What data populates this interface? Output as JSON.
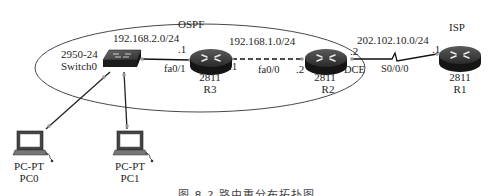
{
  "diagram": {
    "area_label": "OSPF",
    "isp_label": "ISP",
    "networks": [
      {
        "id": "lan",
        "label": "192.168.2.0/24"
      },
      {
        "id": "r3-r2",
        "label": "192.168.1.0/24"
      },
      {
        "id": "r2-r1",
        "label": "202.102.10.0/24"
      }
    ],
    "devices": {
      "switch0": {
        "model": "2950-24",
        "name": "Switch0"
      },
      "r3": {
        "model": "2811",
        "name": "R3"
      },
      "r2": {
        "model": "2811",
        "name": "R2"
      },
      "r1": {
        "model": "2811",
        "name": "R1"
      },
      "pc0": {
        "model": "PC-PT",
        "name": "PC0"
      },
      "pc1": {
        "model": "PC-PT",
        "name": "PC1"
      }
    },
    "interfaces": {
      "r3_lan_ip": ".1",
      "r3_lan_if": "fa0/1",
      "r3_wan_ip": ".1",
      "r2_lan_ip": ".2",
      "r2_lan_if": "fa0/0",
      "r2_serial_ip": ".2",
      "r2_dce": "DCE",
      "r2_serial_if": "S0/0/0",
      "r1_serial_ip": ".1"
    },
    "colors": {
      "router_body": "#1a1a1a",
      "link": "#111111",
      "port_dot": "#9a9a9a"
    }
  },
  "caption": "图 8-?  路由重分布拓扑图"
}
